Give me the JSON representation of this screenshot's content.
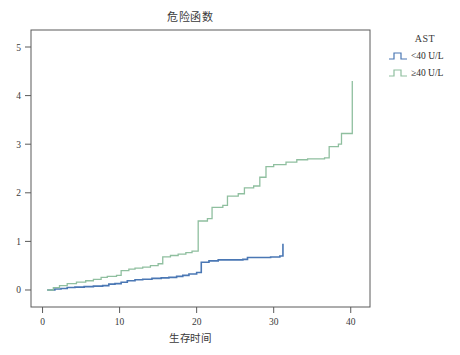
{
  "chart_data": {
    "type": "line",
    "subtype": "step",
    "title": "危险函数",
    "xlabel": "生存时间",
    "ylabel": "",
    "xlim": [
      -1.5,
      42.5
    ],
    "ylim": [
      -0.35,
      5.35
    ],
    "xticks": [
      0,
      10,
      20,
      30,
      40
    ],
    "yticks": [
      0,
      1,
      2,
      3,
      4,
      5
    ],
    "xtick_labels": [
      "0",
      "10",
      "20",
      "30",
      "40"
    ],
    "ytick_labels": [
      "0",
      "1",
      "2",
      "3",
      "4",
      "5"
    ],
    "grid": false,
    "legend_position": "right",
    "legend_title": "AST",
    "series": [
      {
        "name": "<40 U/L",
        "color": "#4a77b4",
        "points": [
          [
            0.6,
            0.0
          ],
          [
            1.6,
            0.02
          ],
          [
            2.4,
            0.03
          ],
          [
            3.2,
            0.05
          ],
          [
            4.2,
            0.06
          ],
          [
            5.4,
            0.07
          ],
          [
            6.6,
            0.08
          ],
          [
            7.8,
            0.09
          ],
          [
            8.6,
            0.12
          ],
          [
            9.4,
            0.13
          ],
          [
            10.2,
            0.16
          ],
          [
            11.0,
            0.19
          ],
          [
            12.0,
            0.21
          ],
          [
            13.0,
            0.22
          ],
          [
            14.2,
            0.24
          ],
          [
            15.4,
            0.25
          ],
          [
            16.4,
            0.26
          ],
          [
            17.4,
            0.28
          ],
          [
            18.2,
            0.3
          ],
          [
            19.0,
            0.33
          ],
          [
            20.0,
            0.36
          ],
          [
            20.6,
            0.57
          ],
          [
            21.6,
            0.6
          ],
          [
            22.8,
            0.62
          ],
          [
            26.0,
            0.63
          ],
          [
            26.6,
            0.67
          ],
          [
            29.6,
            0.68
          ],
          [
            30.8,
            0.7
          ],
          [
            31.2,
            0.95
          ]
        ]
      },
      {
        "name": "≥40 U/L",
        "color": "#8fbf9f",
        "points": [
          [
            0.6,
            0.0
          ],
          [
            1.4,
            0.05
          ],
          [
            2.2,
            0.09
          ],
          [
            3.2,
            0.13
          ],
          [
            4.4,
            0.16
          ],
          [
            5.6,
            0.19
          ],
          [
            6.6,
            0.22
          ],
          [
            7.6,
            0.26
          ],
          [
            8.4,
            0.28
          ],
          [
            9.6,
            0.3
          ],
          [
            10.2,
            0.4
          ],
          [
            11.2,
            0.43
          ],
          [
            12.0,
            0.45
          ],
          [
            13.0,
            0.47
          ],
          [
            14.0,
            0.5
          ],
          [
            15.0,
            0.54
          ],
          [
            15.6,
            0.68
          ],
          [
            16.6,
            0.71
          ],
          [
            17.6,
            0.74
          ],
          [
            18.6,
            0.77
          ],
          [
            19.4,
            0.8
          ],
          [
            20.0,
            0.8
          ],
          [
            20.2,
            1.42
          ],
          [
            21.4,
            1.47
          ],
          [
            22.0,
            1.7
          ],
          [
            23.4,
            1.74
          ],
          [
            24.0,
            1.93
          ],
          [
            25.4,
            1.98
          ],
          [
            26.2,
            2.1
          ],
          [
            27.4,
            2.14
          ],
          [
            28.2,
            2.32
          ],
          [
            29.0,
            2.54
          ],
          [
            30.0,
            2.58
          ],
          [
            31.6,
            2.63
          ],
          [
            33.0,
            2.68
          ],
          [
            34.4,
            2.7
          ],
          [
            36.6,
            2.72
          ],
          [
            37.2,
            2.95
          ],
          [
            38.4,
            3.0
          ],
          [
            38.8,
            3.22
          ],
          [
            40.0,
            3.22
          ],
          [
            40.2,
            4.3
          ]
        ]
      }
    ]
  },
  "legend": {
    "title": "AST",
    "items": [
      {
        "label": "<40 U/L",
        "color": "#4a77b4"
      },
      {
        "label": "≥40 U/L",
        "color": "#8fbf9f"
      }
    ]
  }
}
